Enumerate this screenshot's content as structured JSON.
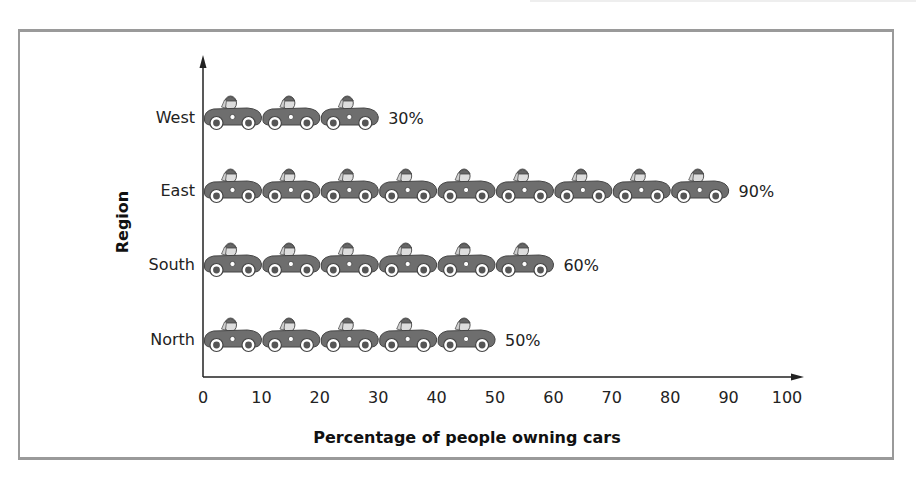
{
  "chart_data": {
    "type": "bar",
    "subtype": "pictograph",
    "title": "",
    "xlabel": "Percentage of people owning cars",
    "ylabel": "Region",
    "categories": [
      "West",
      "East",
      "South",
      "North"
    ],
    "values": [
      30,
      90,
      60,
      50
    ],
    "value_labels": [
      "30%",
      "90%",
      "60%",
      "50%"
    ],
    "xlim": [
      0,
      100
    ],
    "xticks": [
      0,
      10,
      20,
      30,
      40,
      50,
      60,
      70,
      80,
      90,
      100
    ],
    "symbol": "car-icon",
    "symbol_value": 10,
    "grid": false,
    "legend": null
  },
  "colors": {
    "car_body": "#6e6e6e",
    "car_outline": "#444444",
    "frame": "#9a9a9a",
    "axis": "#222222"
  }
}
